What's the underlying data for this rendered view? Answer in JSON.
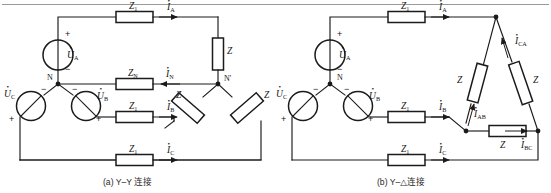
{
  "figure": {
    "top_rule": true,
    "panels": [
      {
        "id": "panel-a",
        "caption": "(a) Y–Y 连接",
        "connection_type": "Y-Y",
        "sources": [
          {
            "name": "source-a",
            "label": "U",
            "sub": "A",
            "dot": true,
            "plus": "+",
            "minus": "−"
          },
          {
            "name": "source-b",
            "label": "U",
            "sub": "B",
            "dot": true,
            "plus": "+",
            "minus": "−"
          },
          {
            "name": "source-c",
            "label": "U",
            "sub": "C",
            "dot": true,
            "plus": "+",
            "minus": "−"
          }
        ],
        "neutral_node": "N",
        "load_node": "N'",
        "line_impedances": [
          {
            "name": "z1-line-a",
            "label": "Z",
            "sub": "1"
          },
          {
            "name": "zn-neutral",
            "label": "Z",
            "sub": "N"
          },
          {
            "name": "z1-line-b",
            "label": "Z",
            "sub": "1"
          },
          {
            "name": "z1-line-c",
            "label": "Z",
            "sub": "1"
          }
        ],
        "load_impedances": [
          {
            "name": "load-z-a",
            "label": "Z"
          },
          {
            "name": "load-z-b",
            "label": "Z"
          },
          {
            "name": "load-z-c",
            "label": "Z"
          }
        ],
        "currents": [
          {
            "name": "current-ia",
            "label": "I",
            "sub": "A",
            "dot": true
          },
          {
            "name": "current-in",
            "label": "I",
            "sub": "N",
            "dot": true
          },
          {
            "name": "current-ib",
            "label": "I",
            "sub": "B",
            "dot": true
          },
          {
            "name": "current-ic",
            "label": "I",
            "sub": "C",
            "dot": true
          }
        ]
      },
      {
        "id": "panel-b",
        "caption": "(b) Y–△连接",
        "connection_type": "Y-Delta",
        "sources": [
          {
            "name": "source-a",
            "label": "U",
            "sub": "A",
            "dot": true,
            "plus": "+",
            "minus": "−"
          },
          {
            "name": "source-b",
            "label": "U",
            "sub": "B",
            "dot": true,
            "plus": "+",
            "minus": "−"
          },
          {
            "name": "source-c",
            "label": "U",
            "sub": "C",
            "dot": true,
            "plus": "+",
            "minus": "−"
          }
        ],
        "neutral_node": "N",
        "line_impedances": [
          {
            "name": "z1-line-a",
            "label": "Z",
            "sub": "1"
          },
          {
            "name": "z1-line-b",
            "label": "Z",
            "sub": "1"
          },
          {
            "name": "z1-line-c",
            "label": "Z",
            "sub": "1"
          }
        ],
        "load_impedances": [
          {
            "name": "load-z-ab",
            "label": "Z"
          },
          {
            "name": "load-z-bc",
            "label": "Z"
          },
          {
            "name": "load-z-ca",
            "label": "Z"
          }
        ],
        "line_currents": [
          {
            "name": "current-ia",
            "label": "I",
            "sub": "A",
            "dot": true
          },
          {
            "name": "current-ib",
            "label": "I",
            "sub": "B",
            "dot": true
          },
          {
            "name": "current-ic",
            "label": "I",
            "sub": "C",
            "dot": true
          }
        ],
        "phase_currents": [
          {
            "name": "current-iab",
            "label": "I",
            "sub": "AB",
            "dot": true
          },
          {
            "name": "current-ibc",
            "label": "I",
            "sub": "BC",
            "dot": true
          },
          {
            "name": "current-ica",
            "label": "I",
            "sub": "CA",
            "dot": true
          }
        ]
      }
    ],
    "colors": {
      "wire": "#1b1b1b",
      "text": "#151515",
      "background": "#ffffff",
      "rule": "#9a9a9a"
    }
  }
}
